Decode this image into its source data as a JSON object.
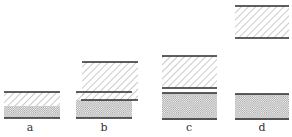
{
  "figure": {
    "panels": [
      {
        "id": "a",
        "label": "a"
      },
      {
        "id": "b",
        "label": "b"
      },
      {
        "id": "c",
        "label": "c"
      },
      {
        "id": "d",
        "label": "d"
      }
    ]
  },
  "colors": {
    "line": "#2a2a2a",
    "hatch": "#8a8a8a",
    "crosshatch": "#9a9a9a",
    "background": "#ffffff"
  }
}
